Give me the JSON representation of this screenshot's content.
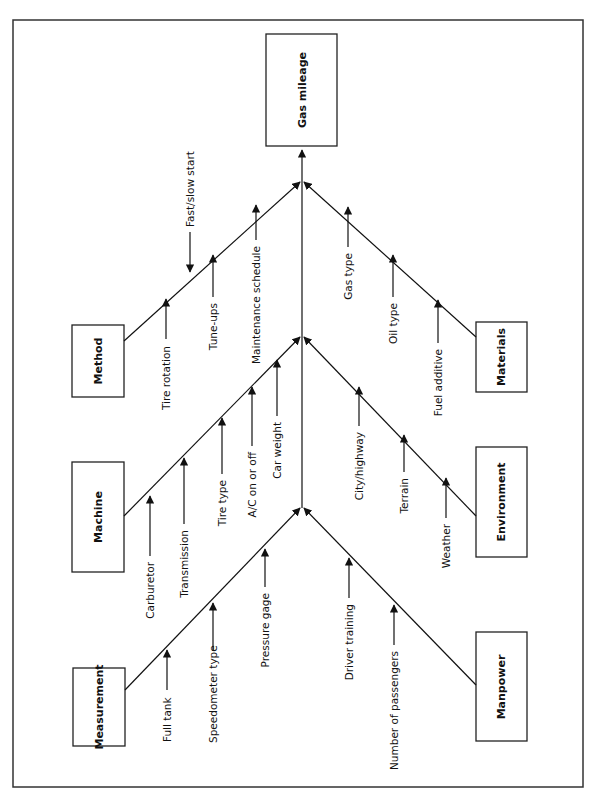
{
  "diagram": {
    "type": "fishbone (cause-and-effect)",
    "orientation": "rotated 90 degrees, effect at top",
    "effect": {
      "label": "Gas mileage"
    },
    "categories": [
      {
        "id": "method",
        "label": "Method",
        "side": "left",
        "causes": [
          "Tire rotation",
          "Fast/slow start",
          "Tune-ups",
          "Maintenance schedule"
        ]
      },
      {
        "id": "machine",
        "label": "Machine",
        "side": "left",
        "causes": [
          "Carburetor",
          "Transmission",
          "Tire type",
          "A/C on or off",
          "Car weight"
        ]
      },
      {
        "id": "measurement",
        "label": "Measurement",
        "side": "left",
        "causes": [
          "Full tank",
          "Speedometer type",
          "Pressure gage"
        ]
      },
      {
        "id": "materials",
        "label": "Materials",
        "side": "right",
        "causes": [
          "Gas type",
          "Oil type",
          "Fuel additive"
        ]
      },
      {
        "id": "environment",
        "label": "Environment",
        "side": "right",
        "causes": [
          "City/highway",
          "Terrain",
          "Weather"
        ]
      },
      {
        "id": "manpower",
        "label": "Manpower",
        "side": "right",
        "causes": [
          "Driver training",
          "Number of passengers"
        ]
      }
    ]
  },
  "colors": {
    "line": "#111111",
    "frame": "#333333",
    "background": "#ffffff"
  }
}
